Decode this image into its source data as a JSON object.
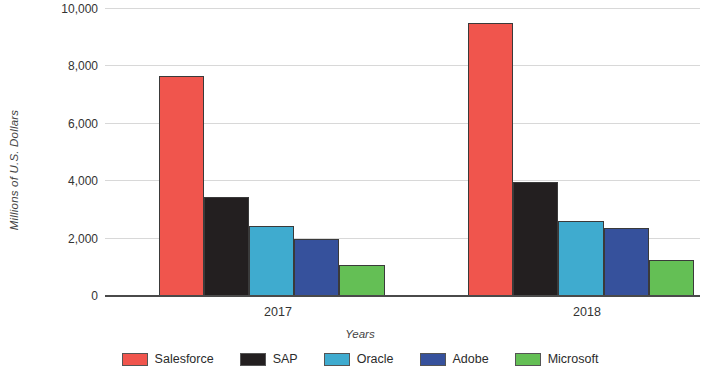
{
  "chart_data": {
    "type": "bar",
    "title": "",
    "subtitle": "",
    "xlabel": "Years",
    "ylabel": "Millions of U.S. Dollars",
    "categories": [
      "2017",
      "2018"
    ],
    "series": [
      {
        "name": "Salesforce",
        "color": "#f0554d",
        "values": [
          7666,
          9509
        ]
      },
      {
        "name": "SAP",
        "color": "#231f20",
        "values": [
          3449,
          3972
        ]
      },
      {
        "name": "Oracle",
        "color": "#3fabcf",
        "values": [
          2440,
          2613
        ]
      },
      {
        "name": "Adobe",
        "color": "#36519c",
        "values": [
          1986,
          2369
        ]
      },
      {
        "name": "Microsoft",
        "color": "#64bf55",
        "values": [
          1080,
          1254
        ]
      }
    ],
    "ylim": [
      0,
      10000
    ],
    "ytick_values": [
      0,
      2000,
      4000,
      6000,
      8000,
      10000
    ],
    "ytick_labels": [
      "0",
      "2,000",
      "4,000",
      "6,000",
      "8,000",
      "10,000"
    ],
    "grid": true,
    "grid_axis": "y",
    "legend_position": "bottom"
  }
}
